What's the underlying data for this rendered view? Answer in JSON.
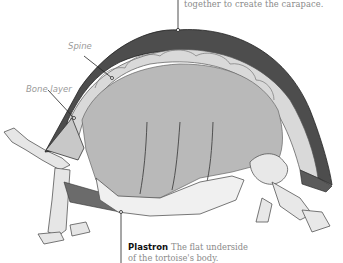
{
  "figure": {
    "callouts": {
      "carapace_caption_tail": "together to create the carapace.",
      "spine": "Spine",
      "bone_layer": "Bone layer",
      "plastron_term": "Plastron",
      "plastron_desc_line1": "The flat underside",
      "plastron_desc_line2": "of the tortoise's body."
    }
  },
  "colors": {
    "shell_outer": "#4a4a4a",
    "shell_band": "#dcdcdc",
    "body_cavity": "#b9b9b9",
    "bone": "#f2f2f2",
    "leader_line": "#222222",
    "caption_text": "#8a8a8a"
  }
}
